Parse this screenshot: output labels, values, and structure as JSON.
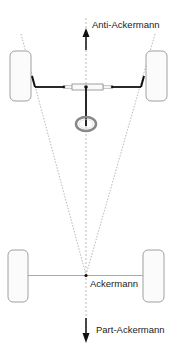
{
  "diagram": {
    "labels": {
      "anti_ackermann": "Anti-Ackermann",
      "ackermann": "Ackermann",
      "part_ackermann": "Part-Ackermann"
    },
    "colors": {
      "background": "#ffffff",
      "wheel_stroke": "#a0a0a0",
      "wheel_fill": "#fbfbfb",
      "linkage": "#111111",
      "construction_lines": "#9a9a9a",
      "rear_axle": "#a8a8a8",
      "text": "#222222"
    },
    "components": [
      "front-left-wheel",
      "front-right-wheel",
      "rear-left-wheel",
      "rear-right-wheel",
      "steering-rack",
      "tie-rods",
      "steering-arms",
      "steering-column",
      "steering-wheel",
      "rear-axle",
      "centerline",
      "ackermann-convergence-lines",
      "forward-arrow",
      "rearward-arrow"
    ]
  }
}
